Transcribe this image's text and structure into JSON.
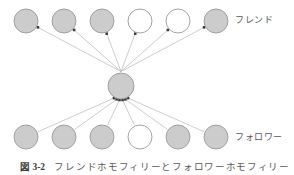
{
  "figure": {
    "caption_number": "図 3-2",
    "caption_text": "フレンドホモフィリーとフォロワーホモフィリー",
    "width": 294,
    "height": 175,
    "background": "#ffffff"
  },
  "labels": {
    "friend": "フレンド",
    "follower": "フォロワー"
  },
  "style": {
    "node_fill_gray": "#cccccc",
    "node_fill_white": "#ffffff",
    "node_stroke": "#999999",
    "edge_stroke": "#aaaaaa",
    "arrow_fill": "#3a3a3a",
    "node_radius": 12,
    "center_radius": 13
  },
  "graph": {
    "type": "directed-node-link",
    "center_node": {
      "id": "ego",
      "cx": 121,
      "cy": 86,
      "r": 13,
      "fill": "#cccccc"
    },
    "friend_nodes": [
      {
        "id": "f1",
        "cx": 26,
        "cy": 21,
        "r": 12,
        "fill": "#cccccc"
      },
      {
        "id": "f2",
        "cx": 64,
        "cy": 21,
        "r": 12,
        "fill": "#cccccc"
      },
      {
        "id": "f3",
        "cx": 102,
        "cy": 21,
        "r": 12,
        "fill": "#cccccc"
      },
      {
        "id": "f4",
        "cx": 140,
        "cy": 21,
        "r": 12,
        "fill": "#ffffff"
      },
      {
        "id": "f5",
        "cx": 178,
        "cy": 21,
        "r": 12,
        "fill": "#ffffff"
      },
      {
        "id": "f6",
        "cx": 216,
        "cy": 21,
        "r": 12,
        "fill": "#cccccc"
      }
    ],
    "follower_nodes": [
      {
        "id": "w1",
        "cx": 26,
        "cy": 137,
        "r": 12,
        "fill": "#cccccc"
      },
      {
        "id": "w2",
        "cx": 64,
        "cy": 137,
        "r": 12,
        "fill": "#cccccc"
      },
      {
        "id": "w3",
        "cx": 102,
        "cy": 137,
        "r": 12,
        "fill": "#cccccc"
      },
      {
        "id": "w4",
        "cx": 140,
        "cy": 137,
        "r": 12,
        "fill": "#ffffff"
      },
      {
        "id": "w5",
        "cx": 178,
        "cy": 137,
        "r": 12,
        "fill": "#cccccc"
      },
      {
        "id": "w6",
        "cx": 216,
        "cy": 137,
        "r": 12,
        "fill": "#cccccc"
      }
    ],
    "friend_edges": [
      {
        "from": "ego",
        "to": "f1",
        "arrow_at": "target"
      },
      {
        "from": "ego",
        "to": "f2",
        "arrow_at": "target"
      },
      {
        "from": "ego",
        "to": "f3",
        "arrow_at": "target"
      },
      {
        "from": "ego",
        "to": "f4",
        "arrow_at": "target"
      },
      {
        "from": "ego",
        "to": "f5",
        "arrow_at": "target"
      },
      {
        "from": "ego",
        "to": "f6",
        "arrow_at": "target"
      }
    ],
    "follower_edges": [
      {
        "from": "w1",
        "to": "ego",
        "arrow_at": "target"
      },
      {
        "from": "w2",
        "to": "ego",
        "arrow_at": "target"
      },
      {
        "from": "w3",
        "to": "ego",
        "arrow_at": "target"
      },
      {
        "from": "w4",
        "to": "ego",
        "arrow_at": "target"
      },
      {
        "from": "w5",
        "to": "ego",
        "arrow_at": "target"
      },
      {
        "from": "w6",
        "to": "ego",
        "arrow_at": "target"
      }
    ]
  }
}
